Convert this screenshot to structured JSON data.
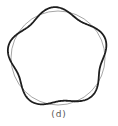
{
  "figure": {
    "caption": "(d)",
    "center": [
      58,
      58
    ],
    "reference_circle": {
      "radius": 47,
      "color": "#a6a6a6",
      "stroke_width": 1
    },
    "perturbed_curve": {
      "mean_radius": 47,
      "amplitude": 4,
      "lobes": 5,
      "phase_deg": -95,
      "color": "#1e1e1e",
      "stroke_width": 1.8
    }
  }
}
